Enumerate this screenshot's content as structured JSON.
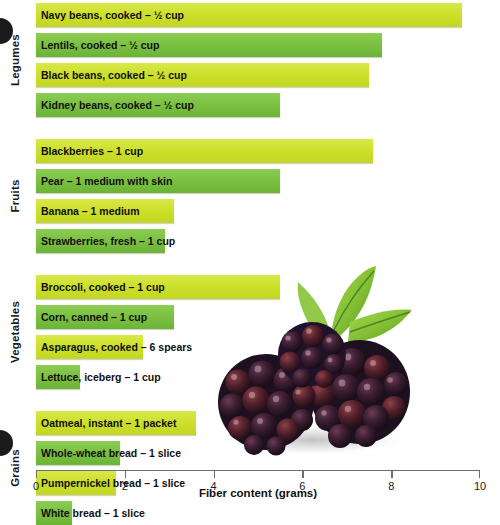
{
  "chart_data": {
    "type": "bar",
    "orientation": "horizontal",
    "title": "",
    "xlabel": "Fiber content (grams)",
    "ylabel": "",
    "xlim": [
      0,
      10
    ],
    "xticks": [
      0,
      2,
      4,
      6,
      8,
      10
    ],
    "xtick_labels": [
      "0",
      "2",
      "4",
      "6",
      "8",
      "10"
    ],
    "grid": false,
    "legend": "none",
    "groups": [
      {
        "name": "Legumes",
        "items": [
          {
            "label": "Navy beans, cooked – ½ cup",
            "value": 9.6,
            "color": "#cde02b"
          },
          {
            "label": "Lentils, cooked – ½ cup",
            "value": 7.8,
            "color": "#7cc142"
          },
          {
            "label": "Black beans, cooked – ½ cup",
            "value": 7.5,
            "color": "#cde02b"
          },
          {
            "label": "Kidney beans, cooked – ½ cup",
            "value": 5.5,
            "color": "#7cc142"
          }
        ]
      },
      {
        "name": "Fruits",
        "items": [
          {
            "label": "Blackberries – 1 cup",
            "value": 7.6,
            "color": "#cde02b"
          },
          {
            "label": "Pear – 1 medium with skin",
            "value": 5.5,
            "color": "#7cc142"
          },
          {
            "label": "Banana – 1 medium",
            "value": 3.1,
            "color": "#cde02b"
          },
          {
            "label": "Strawberries, fresh – 1 cup",
            "value": 2.9,
            "color": "#7cc142"
          }
        ]
      },
      {
        "name": "Vegetables",
        "items": [
          {
            "label": "Broccoli, cooked – 1 cup",
            "value": 5.5,
            "color": "#cde02b"
          },
          {
            "label": "Corn, canned – 1 cup",
            "value": 3.1,
            "color": "#7cc142"
          },
          {
            "label": "Asparagus, cooked – 6 spears",
            "value": 2.4,
            "color": "#cde02b"
          },
          {
            "label": "Lettuce, iceberg – 1 cup",
            "value": 1.0,
            "color": "#7cc142"
          }
        ]
      },
      {
        "name": "Grains",
        "items": [
          {
            "label": "Oatmeal, instant – 1 packet",
            "value": 3.6,
            "color": "#cde02b"
          },
          {
            "label": "Whole-wheat bread – 1 slice",
            "value": 1.9,
            "color": "#7cc142"
          },
          {
            "label": "Pumpernickel bread – 1 slice",
            "value": 1.8,
            "color": "#cde02b"
          },
          {
            "label": "White bread – 1 slice",
            "value": 0.8,
            "color": "#7cc142"
          }
        ]
      }
    ]
  },
  "image": {
    "photo_alt": "blackberries with leaf"
  },
  "colors": {
    "bar_light": "#cde02b",
    "bar_dark": "#7cc142",
    "axis": "#6e6e6e",
    "text": "#101010"
  }
}
